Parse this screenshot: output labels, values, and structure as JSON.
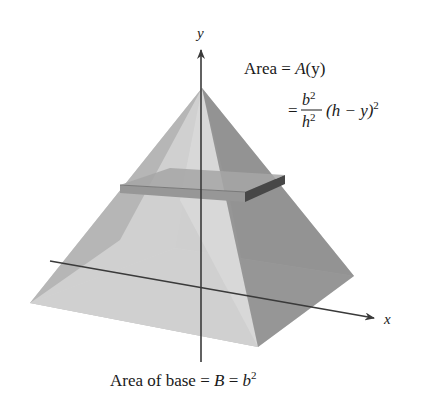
{
  "figure": {
    "axes": {
      "y_label": "y",
      "x_label": "x"
    },
    "annotations": {
      "area_line1_prefix": "Area = ",
      "area_line1_func": "A",
      "area_line1_arg": "(y)",
      "area_line2_eq": "=",
      "frac_num_base": "b",
      "frac_num_exp": "2",
      "frac_den_base": "h",
      "frac_den_exp": "2",
      "area_line2_rest_open": "(h − y)",
      "area_line2_rest_exp": "2",
      "base_prefix": "Area of base = ",
      "base_B": "B",
      "base_eq": " = ",
      "base_b": "b",
      "base_exp": "2"
    },
    "colors": {
      "face_left": "#b4b4b4",
      "face_front": "#dadada",
      "face_right": "#8f8f8f",
      "face_back_inner": "#c8c8c8",
      "slab_top": "#a9a9a9",
      "slab_front": "#9a9a9a",
      "slab_right": "#474747",
      "axis": "#3a3a3a"
    }
  }
}
